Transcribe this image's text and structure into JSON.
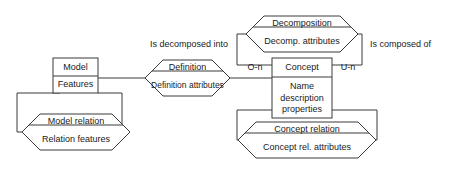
{
  "diagram": {
    "type": "entity-relationship",
    "stroke_color": "#3a3a3a",
    "fill_color": "#ffffff",
    "text_color": "#1a1a1a"
  },
  "entities": {
    "model": {
      "name": "Model",
      "attributes": "Features"
    },
    "concept": {
      "name": "Concept",
      "attributes_line1": "Name",
      "attributes_line2": "description",
      "attributes_line3": "properties"
    }
  },
  "relationships": {
    "model_relation": {
      "name": "Model relation",
      "attributes": "Relation features"
    },
    "definition": {
      "name": "Definition",
      "attributes": "Definition attributes"
    },
    "decomposition": {
      "name": "Decomposition",
      "attributes": "Decomp. attributes"
    },
    "concept_relation": {
      "name": "Concept relation",
      "attributes": "Concept rel. attributes"
    }
  },
  "edge_labels": {
    "is_decomposed_into": "Is decomposed into",
    "is_composed_of": "Is composed of"
  },
  "cardinalities": {
    "left": "O-n",
    "right": "U-n"
  }
}
